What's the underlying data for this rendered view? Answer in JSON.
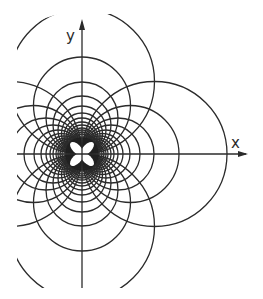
{
  "figure": {
    "type": "circle-family diagram (field lines / equipotentials through origin)",
    "axes": {
      "x_label": "x",
      "y_label": "y",
      "origin_px": [
        82,
        154
      ]
    },
    "families": [
      {
        "name": "circles tangent to y-axis at origin (centers on x-axis)",
        "sides": [
          "right",
          "left"
        ]
      },
      {
        "name": "circles tangent to x-axis at origin (centers on y-axis)",
        "sides": [
          "up",
          "down"
        ]
      }
    ],
    "diameters_px": [
      145,
      97,
      72,
      58,
      48,
      41,
      36,
      32,
      29,
      26,
      24,
      22,
      20,
      18,
      16,
      14,
      12,
      10
    ],
    "line_color": "#2b2b2b",
    "center_petals": 4
  }
}
